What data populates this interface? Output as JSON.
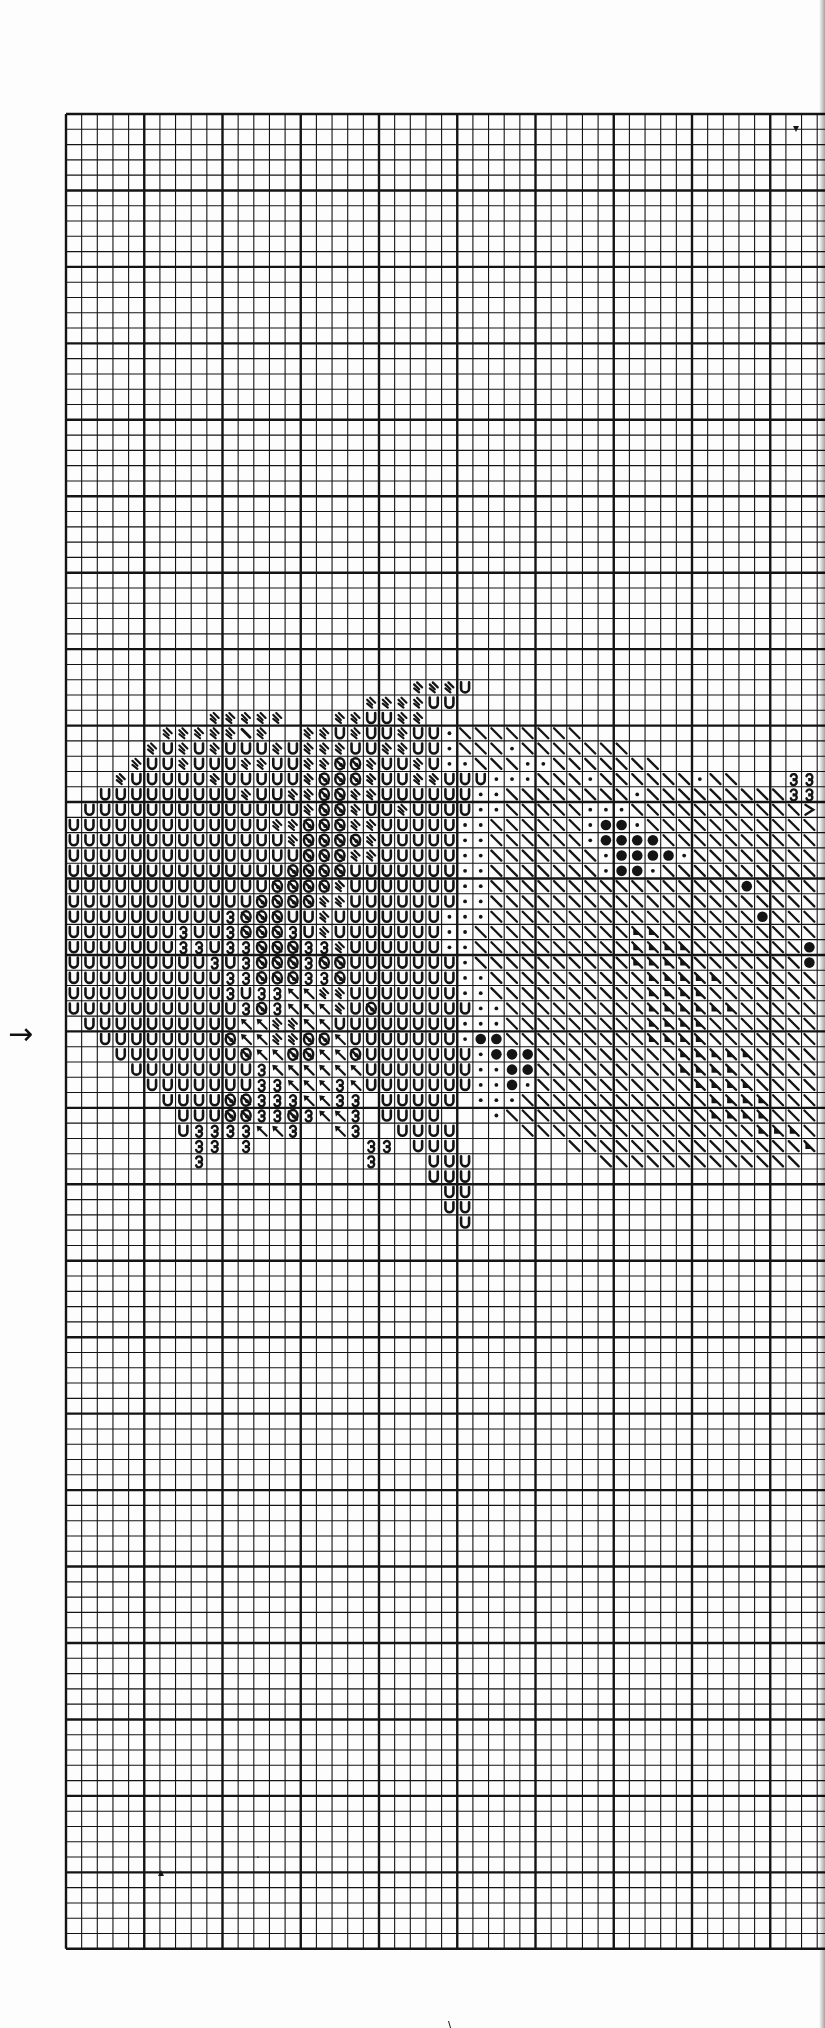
{
  "page": {
    "type": "cross-stitch pattern chart (partial page)",
    "background": "#fdfdfd",
    "ink": "#141414"
  },
  "grid": {
    "left": 66,
    "top": 114,
    "cell_w": 15.65,
    "cell_h": 15.29,
    "cols": 49,
    "rows": 120,
    "major_every": 5
  },
  "marker": {
    "arrow_glyph": "→",
    "row": 60,
    "meaning": "center-row-arrow"
  },
  "legend_symbols": {
    "U": "u-shape",
    "=": "double-slash",
    "/": "single-heavy-slash",
    "o": "slashed-oval (ø)",
    "k": "arrow-up-left (↖)",
    "3": "epsilon (ɜ)",
    ".": "small-dot",
    "\\": "backslash",
    "B": "big-filled-dot",
    "t": "bold-triangle-backslash",
    ">": "chevron-right"
  },
  "stray_marks": [
    {
      "x": 793,
      "y": 132,
      "glyph": "▾"
    },
    {
      "x": 158,
      "y": 1876,
      "glyph": "▴"
    },
    {
      "x": 256,
      "y": 1862,
      "glyph": "·"
    },
    {
      "x": 448,
      "y": 2030,
      "glyph": "\\"
    }
  ],
  "pattern": {
    "start_row": 36,
    "start_col": 0,
    "rows": [
      "                                                  =  =                            ",
      "                      ===U                         ",
      "                   ====UU                          ",
      "         =====   ==UU==                            ",
      "      =====/=  ==U=UU=UU.\\\\\\\\\\\\\\\\                          ",
      "     =U=U=UUU=U===UU==UU.\\\\\\.\\\\\\\\\\\\\\              \\",
      "    =UU=UUU==UU==oo=UU=U..\\\\\\..\\\\\\\\\\\\\\          >>3",
      "   =UUUUU=UUUUU=ooo=UU==UUU...\\\\\\.\\\\\\\\\\\\.\\\\   33>>",
      "  UUUUUUUUU=UU==oo==UUUUUU..\\\\\\\\\\\\\\\\.\\\\\\\\\\\\\\\\\\333>",
      " UUUUUUUUUUUUUU=oo=UU=UUUU..\\\\\\\\\\...\\\\\\\\\\\\\\\\\\\\\\>3>",
      "UUUUUUUUUUUUU==ooo==UUUUU..\\\\\\\\\\\\.BB.\\\\\\\\\\\\\\\\\\\\\\\\>3",
      "UUUUUUUUUUUUUU=oooo=UUUUU..\\\\\\\\\\\\.BBBB\\\\\\\\\\\\\\\\\\\\\\\\>3",
      "UUUUUUUUUUUUUUUooo==UUUUU..\\\\\\\\\\\\\\.BBBB.\\\\\\\\\\\\\\\\\\\\\\>3>",
      "UUUUUUUUUUUUUUooooUUUUUUU..\\\\\\\\\\\\\\.BB.\\\\\\\\\\\\\\\\\\\\\\\\\\>3",
      "UUUUUUUUUUUUUoooo=UUUUUUU..\\\\\\\\\\\\\\\\\\\\\\\\\\\\\\\\B\\\\\\\\\\\\3>",
      "UUUUUUUUUUUUoooo==UUUUUUU..\\\\\\\\\\\\\\\\\\\\\\\\\\\\\\\\\\\\\\\\\\\\\\\\>3",
      "UUUUUUUUUU3oooUU=UUUUUUU...\\\\\\\\\\\\\\\\\\\\\\\\\\\\\\\\\\B\\\\\\\\\\\\\\>3",
      "UUUUUUU3UU3ooo3U=UUUUUUU..\\\\\\\\\\\\\\\\\\\\tt\\\\\\\\\\\\\\\\\\\\\\\\\\>3",
      "UUUUUUU33U33ooo33=UUUUUU..\\\\\\\\\\\\\\\\\\\\tttt\\\\\\\\\\\\\\B\\\\\\\\\\>>3",
      "UUUUUUUUU3U3ooo3ooUUUUUUU.\\\\\\\\\\\\\\\\\\\\tttt\\\\\\\\\\\\\\B\\\\\\\\\\\\>3",
      "UUUUUUUUUU33ooo33oUUUUUUU..\\\\\\\\\\\\\\\\\\\\ttttt\\\\\\\\\\\\\\B\\\\\\\\\\>3",
      "UUUUUUUUUU3U33kk==UUUUUUU..\\\\\\\\\\\\\\\\\\\\tttt\\\\\\\\\\\\\\\\\\\\\\\\\\>3",
      "UUUUUUUUUUU3o3kkk=UoUUUUUU..\\\\\\\\\\\\\\\\\\tttttt\\\\\\\\\\\\\\\\\\\\\\3>",
      " UUUUUUUUUUkk==kkUUUUUUUU...\\\\\\\\\\\\\\\\\\tttt\\\\\\\\\\\\\\\\\\\\\\\\>3",
      "  UUUUUUUUokk==ookUUUUUUU.BB\\\\\\\\\\\\\\\\\\tttt\\\\\\\\\\\\\\\\\\\\\\\\>>",
      "   UUUUUUUUokkookkoUUUUUUU.BBB\\\\\\\\\\\\\\\\\\ttttt\\\\\\\\\\\\\\\\>3",
      "    UUUUUUUU3kkkkkkUUUUUUU..BB\\\\\\\\\\\\\\\\\\tttt\\\\\\\\\\\\\\\\ >3",
      "     UUUUUUU33kkk3kUUUUUUU..B.\\\\\\\\\\\\\\\\\\\\tttt\\\\\\\\\\\\\\   >3",
      "      UUUUoo333kk33 UUUUU ...\\\\\\\\\\\\\\\\\\\\\\\\tttt\\\\\\\\\\\\   >",
      "       UUUoo33o3kk3 UUUU   .\\\\\\\\\\\\\\\\\\\\\\\\\\tttt\\\\\\       >",
      "       U3333kk3  k3  UUUU    \\\\\\\\\\\\\\\\\\\\\\\\\\\\\\ttt\\",
      "        33 3       33 UUU       \\\\\\\\\\\\\\\\\\\\\\\\\\\\\\tt",
      "        3          3   UUU        \\\\\\\\\\\\\\\\\\\\\\\\\\",
      "                       UUU",
      "                        UU",
      "                        UU",
      "                         U"
    ]
  }
}
